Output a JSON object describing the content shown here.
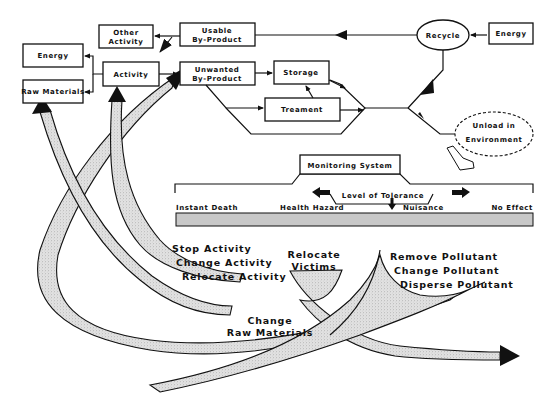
{
  "diagram": {
    "boxes": {
      "energy_left": "Energy",
      "raw_materials": "Raw Materials",
      "activity": "Activity",
      "other_activity_1": "Other",
      "other_activity_2": "Activity",
      "usable_1": "Usable",
      "usable_2": "By-Product",
      "unwanted_1": "Unwanted",
      "unwanted_2": "By-Product",
      "storage": "Storage",
      "treatment": "Treament",
      "recycle": "Recycle",
      "energy_right": "Energy",
      "unload_1": "Unload in",
      "unload_2": "Environment",
      "monitoring": "Monitoring System"
    },
    "tolerance": {
      "label": "Level of Tolerance",
      "scale": [
        "Instant Death",
        "Health Hazard",
        "Nuisance",
        "No Effect"
      ],
      "bar_color": "#c8c8c8"
    },
    "responses": {
      "activity": [
        "Stop Activity",
        "Change Activity",
        "Relocate Activity"
      ],
      "raw_materials": [
        "Change",
        "Raw Materials"
      ],
      "victims": [
        "Relocate",
        "Victims"
      ],
      "pollutant": [
        "Remove Pollutant",
        "Change Pollutant",
        "Disperse Pollutant"
      ]
    },
    "colors": {
      "ink": "#111111",
      "stipple": "#d6d6d6",
      "background": "#ffffff"
    }
  }
}
